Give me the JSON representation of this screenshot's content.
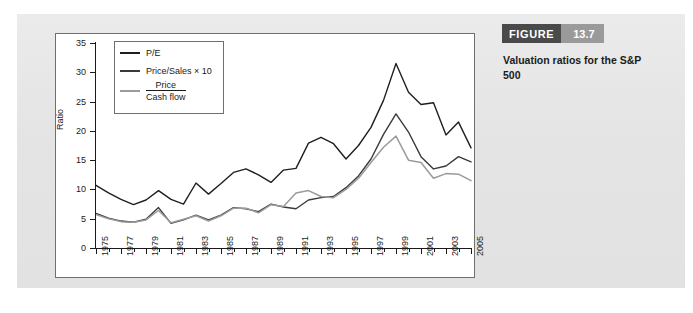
{
  "figure": {
    "badge_word": "FIGURE",
    "badge_number": "13.7",
    "caption": "Valuation ratios for the S&P 500",
    "badge_word_color": "#4a4a4a",
    "badge_number_color": "#9a9a9a",
    "panel_color": "#e6e6e6"
  },
  "legend": {
    "items": [
      {
        "label": "P/E",
        "color": "#1f1f1f",
        "type": "text"
      },
      {
        "label": "Price/Sales × 10",
        "color": "#3a3a3a",
        "type": "text"
      },
      {
        "numerator": "Price",
        "denominator": "Cash flow",
        "color": "#9b9b9b",
        "type": "fraction"
      }
    ]
  },
  "chart_data": {
    "type": "line",
    "title": "Valuation ratios for the S&P 500",
    "xlabel": "",
    "ylabel": "Ratio",
    "ylim": [
      0,
      35
    ],
    "xlim": [
      1975,
      2005
    ],
    "yticks": [
      0,
      5,
      10,
      15,
      20,
      25,
      30,
      35
    ],
    "xticks": [
      1975,
      1977,
      1979,
      1981,
      1983,
      1985,
      1987,
      1989,
      1991,
      1993,
      1995,
      1997,
      1999,
      2001,
      2003,
      2005
    ],
    "xtick_labels": [
      "1975",
      "1977",
      "1979",
      "1981",
      "1983",
      "1985",
      "1987",
      "1989",
      "1991",
      "1993",
      "1995",
      "1997",
      "1999",
      "2001",
      "2003",
      "2005"
    ],
    "grid": false,
    "legend_position": "upper-left",
    "x": [
      1975,
      1976,
      1977,
      1978,
      1979,
      1980,
      1981,
      1982,
      1983,
      1984,
      1985,
      1986,
      1987,
      1988,
      1989,
      1990,
      1991,
      1992,
      1993,
      1994,
      1995,
      1996,
      1997,
      1998,
      1999,
      2000,
      2001,
      2002,
      2003,
      2004,
      2005
    ],
    "series": [
      {
        "name": "P/E",
        "color": "#1f1f1f",
        "values": [
          10.7,
          9.4,
          8.3,
          7.4,
          8.2,
          9.8,
          8.3,
          7.5,
          11.1,
          9.2,
          11.0,
          12.9,
          13.5,
          12.5,
          11.2,
          13.3,
          13.6,
          17.9,
          18.9,
          17.8,
          15.2,
          17.5,
          20.6,
          25.2,
          31.5,
          26.6,
          24.5,
          24.8,
          19.3,
          21.5,
          17.1
        ]
      },
      {
        "name": "Price/Sales × 10",
        "color": "#3a3a3a",
        "values": [
          5.9,
          5.1,
          4.6,
          4.4,
          4.9,
          6.9,
          4.2,
          4.8,
          5.6,
          4.8,
          5.6,
          6.9,
          6.7,
          6.2,
          7.5,
          7.0,
          6.7,
          8.2,
          8.6,
          8.8,
          10.3,
          12.3,
          15.2,
          19.4,
          22.9,
          19.8,
          15.6,
          13.5,
          14.0,
          15.6,
          14.7
        ]
      },
      {
        "name": "Price/Cash flow",
        "color": "#9b9b9b",
        "values": [
          5.7,
          5.0,
          4.5,
          4.4,
          4.8,
          6.4,
          4.3,
          4.9,
          5.5,
          4.6,
          5.5,
          6.8,
          6.8,
          6.0,
          7.4,
          7.1,
          9.4,
          9.8,
          8.8,
          8.6,
          10.0,
          11.9,
          14.6,
          17.2,
          19.1,
          15.0,
          14.6,
          11.9,
          12.7,
          12.6,
          11.5
        ]
      }
    ]
  }
}
